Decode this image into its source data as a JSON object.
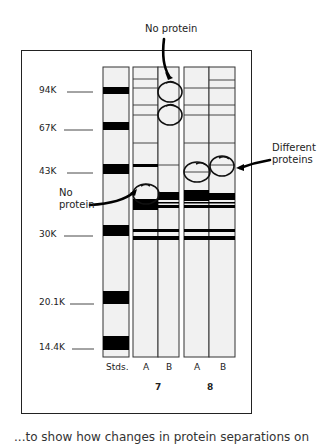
{
  "figure": {
    "annotations": {
      "top_no_protein": "No protein",
      "left_no_protein_line1": "No",
      "left_no_protein_line2": "protein",
      "different_proteins_line1": "Different",
      "different_proteins_line2": "proteins"
    },
    "mw_markers": [
      {
        "label": "94K",
        "y": 90
      },
      {
        "label": "67K",
        "y": 126
      },
      {
        "label": "43K",
        "y": 172
      },
      {
        "label": "30K",
        "y": 233
      },
      {
        "label": "20.1K",
        "y": 301
      },
      {
        "label": "14.4K",
        "y": 346
      }
    ],
    "lanes": [
      {
        "label": "Stds.",
        "group": ""
      },
      {
        "label": "A",
        "group": "7"
      },
      {
        "label": "B",
        "group": "7"
      },
      {
        "label": "A",
        "group": "8"
      },
      {
        "label": "B",
        "group": "8"
      }
    ],
    "groups": [
      "7",
      "8"
    ],
    "caption_partial": "...to show how changes in protein separations on"
  }
}
